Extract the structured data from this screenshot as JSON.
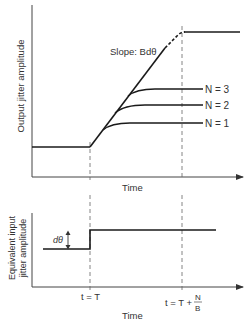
{
  "top_chart": {
    "y_label": "Output jitter amplitude",
    "x_label": "Time",
    "slope_label": "Slope: Bdθ",
    "curves": [
      {
        "label": "N = 3"
      },
      {
        "label": "N = 2"
      },
      {
        "label": "N = 1"
      }
    ]
  },
  "bottom_chart": {
    "y_label_line1": "Equivalent input",
    "y_label_line2": "jitter amplitude",
    "x_label": "Time",
    "step_label": "dθ",
    "tick_t": "t = T",
    "tick_tn_prefix": "t = T +",
    "tick_tn_num": "N",
    "tick_tn_den": "B"
  },
  "colors": {
    "line": "#1a1a1a",
    "axis": "#333333",
    "dashed": "#666666",
    "text": "#333333"
  }
}
